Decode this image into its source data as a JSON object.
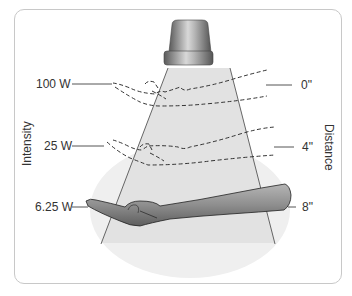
{
  "figure": {
    "axis_labels": {
      "left": "Intensity",
      "right": "Distance"
    },
    "intensity_labels": [
      "100 W",
      "25 W",
      "6.25 W"
    ],
    "distance_labels": [
      "0\"",
      "4\"",
      "8\""
    ],
    "elements": {
      "lamp": "heat-lamp",
      "beam": "light-cone",
      "hand": "outstretched-arm"
    },
    "colors": {
      "frame_border": "#c8c8c8",
      "beam_fill": "#e2e2e2",
      "glow_fill": "#eeeeee",
      "lamp_body": "#8a8a8a",
      "line": "#555555",
      "dash": "#333333",
      "arm": "#8c8c8c"
    }
  }
}
